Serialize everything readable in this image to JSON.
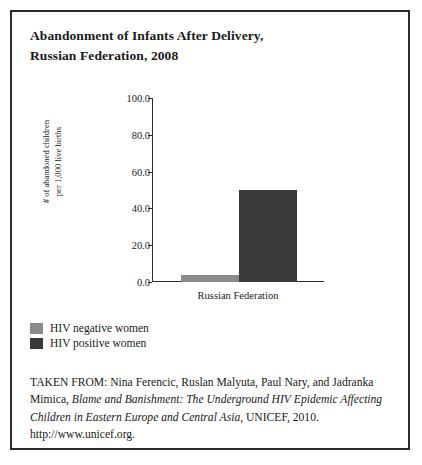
{
  "figure": {
    "title_line1": "Abandonment of Infants After Delivery,",
    "title_line2": "Russian Federation, 2008"
  },
  "ylabel_line1": "# of abandoned children",
  "ylabel_line2": "per 1,000 live births",
  "legend": [
    {
      "label": "HIV negative women",
      "color": "#8a8a8a"
    },
    {
      "label": "HIV positive women",
      "color": "#3a3a3a"
    }
  ],
  "source": {
    "intro": "TAKEN FROM: Nina Ferencic, Ruslan Malyuta, Paul Nary, and",
    "author_tail": "Jadranka Mimica, ",
    "work_part1": "Blame and Banishment: The Underground HIV",
    "work_part2": "Epidemic Affecting Children in Eastern Europe and Central Asia,",
    "tail": "UNICEF, 2010. http://www.unicef.org."
  },
  "chart_data": {
    "type": "bar",
    "title": "Abandonment of Infants After Delivery, Russian Federation, 2008",
    "xlabel": "",
    "ylabel": "# of abandoned children per 1,000 live births",
    "categories": [
      "Russian Federation"
    ],
    "series": [
      {
        "name": "HIV negative women",
        "values": [
          4.0
        ],
        "color": "#8a8a8a"
      },
      {
        "name": "HIV positive women",
        "values": [
          50.0
        ],
        "color": "#3a3a3a"
      }
    ],
    "ylim": [
      0.0,
      100.0
    ],
    "yticks": [
      0.0,
      20.0,
      40.0,
      60.0,
      80.0,
      100.0
    ],
    "ytick_labels": [
      "0.0",
      "20.0",
      "40.0",
      "60.0",
      "80.0",
      "100.0"
    ],
    "grid": false,
    "legend_position": "below-plot-left"
  }
}
